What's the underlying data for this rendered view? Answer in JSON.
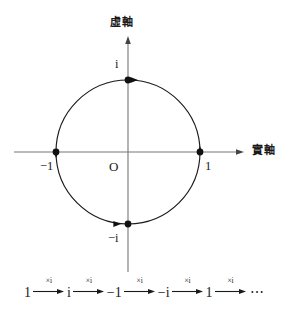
{
  "figure": {
    "type": "complex-unit-circle-diagram",
    "axes": {
      "imaginary_axis_label": "虛軸",
      "real_axis_label": "實軸",
      "origin_label": "O"
    },
    "circle": {
      "center_x": 128,
      "center_y": 152,
      "radius": 72,
      "stroke": "#1a1a1a"
    },
    "points": [
      {
        "label": "1",
        "x": 200,
        "y": 152,
        "arrow_direction": "up"
      },
      {
        "label": "i",
        "x": 128,
        "y": 80,
        "arrow_direction": "left"
      },
      {
        "label": "−1",
        "x": 56,
        "y": 152,
        "arrow_direction": "down"
      },
      {
        "label": "−i",
        "x": 128,
        "y": 224,
        "arrow_direction": "right"
      }
    ]
  },
  "sequence": {
    "terms": [
      "1",
      "i",
      "−1",
      "−i",
      "1"
    ],
    "arrow_label": "×i",
    "ellipsis": "⋯"
  }
}
